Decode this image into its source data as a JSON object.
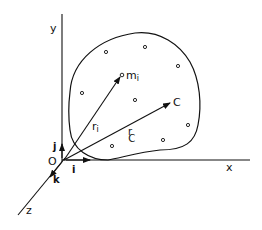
{
  "diagram": {
    "axes": {
      "x_label": "x",
      "y_label": "y",
      "z_label": "z",
      "origin_label": "O"
    },
    "unit_vectors": {
      "i_label": "i",
      "j_label": "j",
      "k_label": "k"
    },
    "vectors": [
      {
        "name": "r_i",
        "base": "r",
        "sub": "i",
        "target_label": "m",
        "target_sub": "i"
      },
      {
        "name": "r_C",
        "base": "r",
        "sub": "C",
        "target_label": "C"
      }
    ],
    "particles_count": 9,
    "colors": {
      "ink": "#111111",
      "background": "#ffffff"
    }
  }
}
